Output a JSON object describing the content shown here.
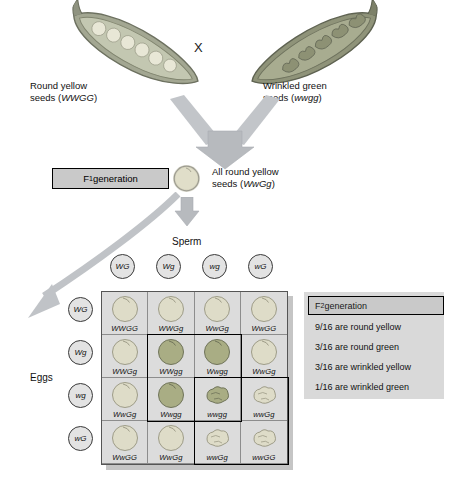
{
  "figure": {
    "cross_symbol": "X"
  },
  "parents": {
    "left": {
      "label_line1": "Round yellow",
      "label_line2_prefix": "seeds (",
      "genotype": "WWGG",
      "label_line2_suffix": ")",
      "pod_type": "round-yellow-pea-pod"
    },
    "right": {
      "label_line1": "Wrinkled green",
      "label_line2_prefix": "seeds (",
      "genotype": "wwgg",
      "label_line2_suffix": ")",
      "pod_type": "wrinkled-green-pea-pod"
    }
  },
  "f1": {
    "box_label": "F",
    "box_sub": "1",
    "box_label_rest": " generation",
    "description_line1": "All round yellow",
    "description_prefix": "seeds (",
    "genotype": "WwGg",
    "description_suffix": ")"
  },
  "axes": {
    "sperm_label": "Sperm",
    "eggs_label": "Eggs",
    "sperm_gametes": [
      "WG",
      "Wg",
      "wg",
      "wG"
    ],
    "egg_gametes": [
      "WG",
      "Wg",
      "wg",
      "wG"
    ]
  },
  "punnett": {
    "rows": [
      [
        {
          "genotype": "WWGG",
          "shape": "round",
          "color": "yellow"
        },
        {
          "genotype": "WWGg",
          "shape": "round",
          "color": "yellow"
        },
        {
          "genotype": "WwGg",
          "shape": "round",
          "color": "yellow"
        },
        {
          "genotype": "WwGG",
          "shape": "round",
          "color": "yellow"
        }
      ],
      [
        {
          "genotype": "WWGg",
          "shape": "round",
          "color": "yellow"
        },
        {
          "genotype": "WWgg",
          "shape": "round",
          "color": "green"
        },
        {
          "genotype": "Wwgg",
          "shape": "round",
          "color": "green"
        },
        {
          "genotype": "WwGg",
          "shape": "round",
          "color": "yellow"
        }
      ],
      [
        {
          "genotype": "WwGg",
          "shape": "round",
          "color": "yellow"
        },
        {
          "genotype": "Wwgg",
          "shape": "round",
          "color": "green"
        },
        {
          "genotype": "wwgg",
          "shape": "wrinkled",
          "color": "green"
        },
        {
          "genotype": "wwGg",
          "shape": "wrinkled",
          "color": "yellow"
        }
      ],
      [
        {
          "genotype": "WwGG",
          "shape": "round",
          "color": "yellow"
        },
        {
          "genotype": "WwGg",
          "shape": "round",
          "color": "yellow"
        },
        {
          "genotype": "wwGg",
          "shape": "wrinkled",
          "color": "yellow"
        },
        {
          "genotype": "wwGG",
          "shape": "wrinkled",
          "color": "yellow"
        }
      ]
    ]
  },
  "f2_legend": {
    "heading": "F",
    "heading_sub": "2",
    "heading_rest": " generation",
    "ratios": [
      "9/16 are round yellow",
      "3/16 are round green",
      "3/16 are wrinkled yellow",
      "1/16 are wrinkled green"
    ]
  },
  "colors": {
    "seed_yellow": "#dedcc8",
    "seed_green": "#a9ad84",
    "panel_gray": "#d9d9d9",
    "box_gray": "#c9c9c9",
    "arrow_gray": "#b9bcc0",
    "pod_green": "#9b9f86"
  }
}
